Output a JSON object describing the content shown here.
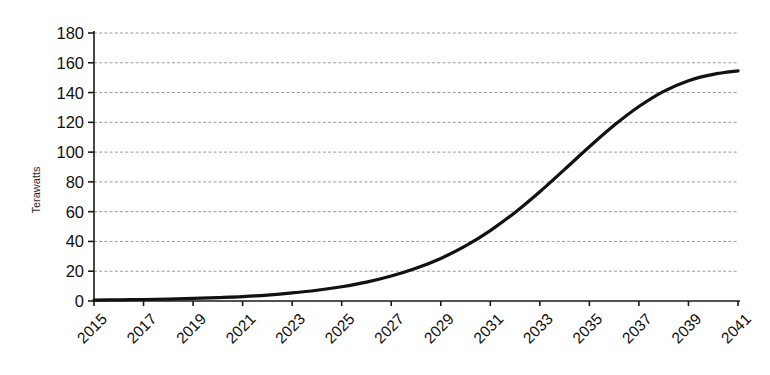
{
  "chart_data": {
    "type": "line",
    "title": "",
    "xlabel": "",
    "ylabel": "Terawatts",
    "ylim": [
      0,
      180
    ],
    "ytick_step": 20,
    "yticks": [
      0,
      20,
      40,
      60,
      80,
      100,
      120,
      140,
      160,
      180
    ],
    "xlim": [
      2015,
      2041
    ],
    "xticks": [
      2015,
      2017,
      2019,
      2021,
      2023,
      2025,
      2027,
      2029,
      2031,
      2033,
      2035,
      2037,
      2039,
      2041
    ],
    "xtick_rotation": 45,
    "grid": "horizontal-dashed",
    "legend": "none",
    "series": [
      {
        "name": "Terawatts",
        "color": "#111111",
        "x": [
          2015,
          2016,
          2017,
          2018,
          2019,
          2020,
          2021,
          2022,
          2023,
          2024,
          2025,
          2026,
          2027,
          2028,
          2029,
          2030,
          2031,
          2032,
          2033,
          2034,
          2035,
          2036,
          2037,
          2038,
          2039,
          2040,
          2041
        ],
        "values": [
          0.6,
          0.8,
          1.0,
          1.3,
          1.7,
          2.3,
          3.0,
          4.0,
          5.4,
          7.2,
          9.6,
          12.7,
          16.8,
          22.0,
          28.6,
          37.0,
          47.3,
          59.5,
          73.4,
          88.4,
          103.6,
          118.0,
          130.6,
          140.8,
          148.0,
          152.2,
          154.6
        ]
      }
    ],
    "grid_color": "#9a9a9a",
    "axis_color": "#1a1a1a",
    "background": "#ffffff"
  },
  "axis_labels": {
    "y_axis_title": "Terawatts"
  }
}
